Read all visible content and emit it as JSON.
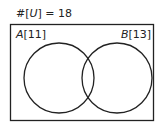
{
  "diagram": {
    "type": "venn",
    "universe": {
      "label_prefix": "#[",
      "symbol": "U",
      "label_suffix": "] = ",
      "count": "18"
    },
    "sets": [
      {
        "name": "A",
        "count_text": "[11]"
      },
      {
        "name": "B",
        "count_text": "[13]"
      }
    ],
    "colors": {
      "stroke": "#222222",
      "background": "#ffffff"
    }
  }
}
